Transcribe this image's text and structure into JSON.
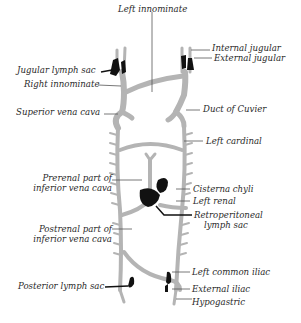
{
  "figure": {
    "colors": {
      "vein": "#b4b4b4",
      "lymph_sac": "#111111",
      "leader": "#555555",
      "text": "#2a2a2a"
    }
  },
  "labels": {
    "left_innominate": "Left innominate",
    "internal_jugular": "Internal jugular",
    "external_jugular": "External jugular",
    "jugular_lymph_sac": "Jugular lymph sac",
    "right_innominate": "Right innominate",
    "superior_vena_cava": "Superior vena cava",
    "duct_of_cuvier": "Duct of Cuvier",
    "left_cardinal": "Left cardinal",
    "prerenal_line1": "Prerenal part of",
    "prerenal_line2": "inferior vena cava",
    "cisterna_chyli": "Cisterna chyli",
    "left_renal": "Left renal",
    "retroperitoneal_line1": "Retroperitoneal",
    "retroperitoneal_line2": "lymph sac",
    "postrenal_line1": "Postrenal part of",
    "postrenal_line2": "inferior vena cava",
    "posterior_lymph_sac": "Posterior lymph sac",
    "left_common_iliac": "Left common iliac",
    "external_iliac": "External iliac",
    "hypogastric": "Hypogastric"
  }
}
